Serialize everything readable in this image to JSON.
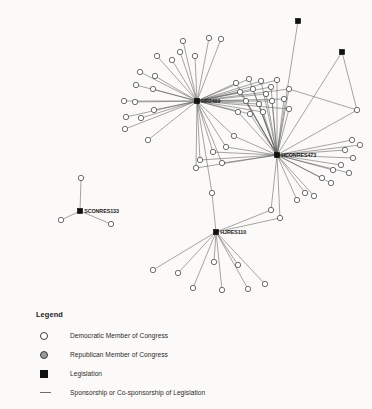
{
  "legend": {
    "title": "Legend",
    "items": [
      {
        "marker": "hollow-circle-icon",
        "label": "Democratic Member of Congress"
      },
      {
        "marker": "gray-circle-icon",
        "label": "Republican Member of Congress"
      },
      {
        "marker": "black-square-icon",
        "label": "Legislation"
      },
      {
        "marker": "line-icon",
        "label": "Sponsorship or Co-sponsorship of Legislation"
      }
    ]
  },
  "colors": {
    "background": "#fbfaf8",
    "edge": "#5b5b5b",
    "member_fill": "#ffffff",
    "member_stroke": "#4a4a4a",
    "republican_fill": "#9a9a9a",
    "legislation_fill": "#111111",
    "label_text": "#1a1a1a"
  },
  "chart_data": {
    "type": "network",
    "title": "",
    "node_types": [
      "legislation",
      "democratic-member",
      "republican-member"
    ],
    "edge_meaning": "Sponsorship or Co-sponsorship of Legislation",
    "bills": [
      {
        "id": "HR2499",
        "label": "HR2499",
        "x": 197,
        "y": 101,
        "show_label": true
      },
      {
        "id": "HCONRES473",
        "label": "HCONRES473",
        "x": 277,
        "y": 155,
        "show_label": true
      },
      {
        "id": "HJRES110",
        "label": "HJRES110",
        "x": 216,
        "y": 232,
        "show_label": true
      },
      {
        "id": "SCONRES133",
        "label": "SCONRES133",
        "x": 80,
        "y": 211,
        "show_label": true
      },
      {
        "id": "BILL-TOPRIGHT-1",
        "label": "",
        "x": 298,
        "y": 21,
        "show_label": false
      },
      {
        "id": "BILL-TOPRIGHT-2",
        "label": "",
        "x": 342,
        "y": 52,
        "show_label": false
      }
    ],
    "members": [
      {
        "id": "m1",
        "x": 183,
        "y": 41,
        "party": "D"
      },
      {
        "id": "m2",
        "x": 209,
        "y": 38,
        "party": "D"
      },
      {
        "id": "m3",
        "x": 221,
        "y": 39,
        "party": "D"
      },
      {
        "id": "m4",
        "x": 180,
        "y": 52,
        "party": "D"
      },
      {
        "id": "m5",
        "x": 195,
        "y": 56,
        "party": "D"
      },
      {
        "id": "m6",
        "x": 157,
        "y": 56,
        "party": "D"
      },
      {
        "id": "m7",
        "x": 172,
        "y": 60,
        "party": "D"
      },
      {
        "id": "m8",
        "x": 140,
        "y": 72,
        "party": "D"
      },
      {
        "id": "m9",
        "x": 155,
        "y": 76,
        "party": "D"
      },
      {
        "id": "m10",
        "x": 136,
        "y": 85,
        "party": "D"
      },
      {
        "id": "m11",
        "x": 153,
        "y": 89,
        "party": "D"
      },
      {
        "id": "m12",
        "x": 124,
        "y": 101,
        "party": "D"
      },
      {
        "id": "m13",
        "x": 135,
        "y": 102,
        "party": "D"
      },
      {
        "id": "m14",
        "x": 154,
        "y": 110,
        "party": "D"
      },
      {
        "id": "m15",
        "x": 126,
        "y": 117,
        "party": "D"
      },
      {
        "id": "m16",
        "x": 141,
        "y": 118,
        "party": "D"
      },
      {
        "id": "m17",
        "x": 125,
        "y": 129,
        "party": "D"
      },
      {
        "id": "m18",
        "x": 148,
        "y": 140,
        "party": "D"
      },
      {
        "id": "m19",
        "x": 236,
        "y": 83,
        "party": "D"
      },
      {
        "id": "m20",
        "x": 249,
        "y": 79,
        "party": "D"
      },
      {
        "id": "m21",
        "x": 261,
        "y": 81,
        "party": "D"
      },
      {
        "id": "m22",
        "x": 271,
        "y": 87,
        "party": "D"
      },
      {
        "id": "m23",
        "x": 240,
        "y": 92,
        "party": "D"
      },
      {
        "id": "m24",
        "x": 253,
        "y": 89,
        "party": "D"
      },
      {
        "id": "m25",
        "x": 266,
        "y": 94,
        "party": "D"
      },
      {
        "id": "m26",
        "x": 277,
        "y": 80,
        "party": "D"
      },
      {
        "id": "m27",
        "x": 289,
        "y": 89,
        "party": "D"
      },
      {
        "id": "m28",
        "x": 246,
        "y": 101,
        "party": "D"
      },
      {
        "id": "m29",
        "x": 259,
        "y": 104,
        "party": "D"
      },
      {
        "id": "m30",
        "x": 272,
        "y": 101,
        "party": "D"
      },
      {
        "id": "m31",
        "x": 284,
        "y": 99,
        "party": "D"
      },
      {
        "id": "m32",
        "x": 238,
        "y": 112,
        "party": "D"
      },
      {
        "id": "m33",
        "x": 250,
        "y": 114,
        "party": "D"
      },
      {
        "id": "m34",
        "x": 263,
        "y": 112,
        "party": "D"
      },
      {
        "id": "m35",
        "x": 289,
        "y": 109,
        "party": "D"
      },
      {
        "id": "m36",
        "x": 234,
        "y": 136,
        "party": "D"
      },
      {
        "id": "m37",
        "x": 226,
        "y": 147,
        "party": "D"
      },
      {
        "id": "m38",
        "x": 213,
        "y": 152,
        "party": "D"
      },
      {
        "id": "m39",
        "x": 200,
        "y": 160,
        "party": "D"
      },
      {
        "id": "m40",
        "x": 222,
        "y": 163,
        "party": "D"
      },
      {
        "id": "m41",
        "x": 196,
        "y": 168,
        "party": "D"
      },
      {
        "id": "m42",
        "x": 212,
        "y": 193,
        "party": "D"
      },
      {
        "id": "m43",
        "x": 357,
        "y": 110,
        "party": "D"
      },
      {
        "id": "m44",
        "x": 352,
        "y": 140,
        "party": "D"
      },
      {
        "id": "m45",
        "x": 360,
        "y": 145,
        "party": "D"
      },
      {
        "id": "m46",
        "x": 345,
        "y": 150,
        "party": "D"
      },
      {
        "id": "m47",
        "x": 353,
        "y": 158,
        "party": "D"
      },
      {
        "id": "m48",
        "x": 341,
        "y": 165,
        "party": "D"
      },
      {
        "id": "m49",
        "x": 333,
        "y": 170,
        "party": "D"
      },
      {
        "id": "m50",
        "x": 349,
        "y": 173,
        "party": "D"
      },
      {
        "id": "m51",
        "x": 322,
        "y": 178,
        "party": "D"
      },
      {
        "id": "m52",
        "x": 331,
        "y": 183,
        "party": "D"
      },
      {
        "id": "m53",
        "x": 305,
        "y": 193,
        "party": "D"
      },
      {
        "id": "m54",
        "x": 314,
        "y": 196,
        "party": "D"
      },
      {
        "id": "m55",
        "x": 297,
        "y": 200,
        "party": "D"
      },
      {
        "id": "m56",
        "x": 271,
        "y": 210,
        "party": "D"
      },
      {
        "id": "m57",
        "x": 280,
        "y": 218,
        "party": "D"
      },
      {
        "id": "m58",
        "x": 153,
        "y": 270,
        "party": "D"
      },
      {
        "id": "m59",
        "x": 178,
        "y": 273,
        "party": "D"
      },
      {
        "id": "m60",
        "x": 193,
        "y": 288,
        "party": "D"
      },
      {
        "id": "m61",
        "x": 222,
        "y": 290,
        "party": "D"
      },
      {
        "id": "m62",
        "x": 248,
        "y": 289,
        "party": "D"
      },
      {
        "id": "m63",
        "x": 265,
        "y": 284,
        "party": "D"
      },
      {
        "id": "m64",
        "x": 214,
        "y": 262,
        "party": "D"
      },
      {
        "id": "m65",
        "x": 238,
        "y": 265,
        "party": "D"
      },
      {
        "id": "m66",
        "x": 81,
        "y": 178,
        "party": "D"
      },
      {
        "id": "m67",
        "x": 61,
        "y": 220,
        "party": "D"
      },
      {
        "id": "m68",
        "x": 111,
        "y": 224,
        "party": "D"
      }
    ],
    "edges": [
      {
        "from": "HR2499",
        "to": "m1"
      },
      {
        "from": "HR2499",
        "to": "m2"
      },
      {
        "from": "HR2499",
        "to": "m3"
      },
      {
        "from": "HR2499",
        "to": "m4"
      },
      {
        "from": "HR2499",
        "to": "m5"
      },
      {
        "from": "HR2499",
        "to": "m6"
      },
      {
        "from": "HR2499",
        "to": "m7"
      },
      {
        "from": "HR2499",
        "to": "m8"
      },
      {
        "from": "HR2499",
        "to": "m9"
      },
      {
        "from": "HR2499",
        "to": "m10"
      },
      {
        "from": "HR2499",
        "to": "m11"
      },
      {
        "from": "HR2499",
        "to": "m12"
      },
      {
        "from": "HR2499",
        "to": "m13"
      },
      {
        "from": "HR2499",
        "to": "m14"
      },
      {
        "from": "HR2499",
        "to": "m15"
      },
      {
        "from": "HR2499",
        "to": "m16"
      },
      {
        "from": "HR2499",
        "to": "m17"
      },
      {
        "from": "HR2499",
        "to": "m18"
      },
      {
        "from": "HR2499",
        "to": "m19"
      },
      {
        "from": "HR2499",
        "to": "m20"
      },
      {
        "from": "HR2499",
        "to": "m21"
      },
      {
        "from": "HR2499",
        "to": "m22"
      },
      {
        "from": "HR2499",
        "to": "m23"
      },
      {
        "from": "HR2499",
        "to": "m24"
      },
      {
        "from": "HR2499",
        "to": "m25"
      },
      {
        "from": "HR2499",
        "to": "m26"
      },
      {
        "from": "HR2499",
        "to": "m27"
      },
      {
        "from": "HR2499",
        "to": "m28"
      },
      {
        "from": "HR2499",
        "to": "m29"
      },
      {
        "from": "HR2499",
        "to": "m30"
      },
      {
        "from": "HR2499",
        "to": "m31"
      },
      {
        "from": "HR2499",
        "to": "m32"
      },
      {
        "from": "HR2499",
        "to": "m33"
      },
      {
        "from": "HR2499",
        "to": "m34"
      },
      {
        "from": "HR2499",
        "to": "m35"
      },
      {
        "from": "HR2499",
        "to": "m36"
      },
      {
        "from": "HR2499",
        "to": "m37"
      },
      {
        "from": "HR2499",
        "to": "m38"
      },
      {
        "from": "HR2499",
        "to": "m39"
      },
      {
        "from": "HR2499",
        "to": "m40"
      },
      {
        "from": "HR2499",
        "to": "m41"
      },
      {
        "from": "HR2499",
        "to": "m42"
      },
      {
        "from": "HCONRES473",
        "to": "m19"
      },
      {
        "from": "HCONRES473",
        "to": "m20"
      },
      {
        "from": "HCONRES473",
        "to": "m21"
      },
      {
        "from": "HCONRES473",
        "to": "m22"
      },
      {
        "from": "HCONRES473",
        "to": "m23"
      },
      {
        "from": "HCONRES473",
        "to": "m24"
      },
      {
        "from": "HCONRES473",
        "to": "m25"
      },
      {
        "from": "HCONRES473",
        "to": "m26"
      },
      {
        "from": "HCONRES473",
        "to": "m27"
      },
      {
        "from": "HCONRES473",
        "to": "m28"
      },
      {
        "from": "HCONRES473",
        "to": "m29"
      },
      {
        "from": "HCONRES473",
        "to": "m30"
      },
      {
        "from": "HCONRES473",
        "to": "m31"
      },
      {
        "from": "HCONRES473",
        "to": "m32"
      },
      {
        "from": "HCONRES473",
        "to": "m33"
      },
      {
        "from": "HCONRES473",
        "to": "m34"
      },
      {
        "from": "HCONRES473",
        "to": "m35"
      },
      {
        "from": "HCONRES473",
        "to": "m36"
      },
      {
        "from": "HCONRES473",
        "to": "m37"
      },
      {
        "from": "HCONRES473",
        "to": "m38"
      },
      {
        "from": "HCONRES473",
        "to": "m39"
      },
      {
        "from": "HCONRES473",
        "to": "m40"
      },
      {
        "from": "HCONRES473",
        "to": "m41"
      },
      {
        "from": "HCONRES473",
        "to": "m43"
      },
      {
        "from": "HCONRES473",
        "to": "m44"
      },
      {
        "from": "HCONRES473",
        "to": "m45"
      },
      {
        "from": "HCONRES473",
        "to": "m46"
      },
      {
        "from": "HCONRES473",
        "to": "m47"
      },
      {
        "from": "HCONRES473",
        "to": "m48"
      },
      {
        "from": "HCONRES473",
        "to": "m49"
      },
      {
        "from": "HCONRES473",
        "to": "m50"
      },
      {
        "from": "HCONRES473",
        "to": "m51"
      },
      {
        "from": "HCONRES473",
        "to": "m52"
      },
      {
        "from": "HCONRES473",
        "to": "m53"
      },
      {
        "from": "HCONRES473",
        "to": "m54"
      },
      {
        "from": "HCONRES473",
        "to": "m55"
      },
      {
        "from": "HCONRES473",
        "to": "m56"
      },
      {
        "from": "HCONRES473",
        "to": "m57"
      },
      {
        "from": "HCONRES473",
        "to": "BILL-TOPRIGHT-1"
      },
      {
        "from": "HCONRES473",
        "to": "BILL-TOPRIGHT-2"
      },
      {
        "from": "BILL-TOPRIGHT-2",
        "to": "m43"
      },
      {
        "from": "m43",
        "to": "m27"
      },
      {
        "from": "HJRES110",
        "to": "m58"
      },
      {
        "from": "HJRES110",
        "to": "m59"
      },
      {
        "from": "HJRES110",
        "to": "m60"
      },
      {
        "from": "HJRES110",
        "to": "m61"
      },
      {
        "from": "HJRES110",
        "to": "m62"
      },
      {
        "from": "HJRES110",
        "to": "m63"
      },
      {
        "from": "HJRES110",
        "to": "m64"
      },
      {
        "from": "HJRES110",
        "to": "m65"
      },
      {
        "from": "HJRES110",
        "to": "m42"
      },
      {
        "from": "HJRES110",
        "to": "m57"
      },
      {
        "from": "HJRES110",
        "to": "m56"
      },
      {
        "from": "SCONRES133",
        "to": "m66"
      },
      {
        "from": "SCONRES133",
        "to": "m67"
      },
      {
        "from": "SCONRES133",
        "to": "m68"
      }
    ]
  }
}
